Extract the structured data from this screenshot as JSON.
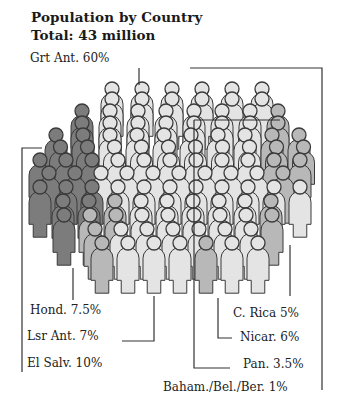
{
  "chart_data": {
    "type": "pictogram",
    "title": "Population by Country",
    "subtitle": "Total: 43 million",
    "total_millions": 43,
    "unit": "% of population",
    "categories": [
      "Grt Ant.",
      "El Salv.",
      "Hond.",
      "Lsr Ant.",
      "C. Rica",
      "Nicar.",
      "Pan.",
      "Baham./Bel./Ber."
    ],
    "values": [
      60,
      10,
      7.5,
      7,
      5,
      6,
      3.5,
      1
    ],
    "labels": [
      {
        "name": "Grt Ant.",
        "value": "60%",
        "text": "Grt Ant. 60%"
      },
      {
        "name": "Hond.",
        "value": "7.5%",
        "text": "Hond. 7.5%"
      },
      {
        "name": "Lsr Ant.",
        "value": "7%",
        "text": "Lsr Ant. 7%"
      },
      {
        "name": "El Salv.",
        "value": "10%",
        "text": "El Salv. 10%"
      },
      {
        "name": "C. Rica",
        "value": "5%",
        "text": "C. Rica 5%"
      },
      {
        "name": "Nicar.",
        "value": "6%",
        "text": "Nicar. 6%"
      },
      {
        "name": "Pan.",
        "value": "3.5%",
        "text": "Pan. 3.5%"
      },
      {
        "name": "Baham./Bel./Ber.",
        "value": "1%",
        "text": "Baham./Bel./Ber. 1%"
      }
    ],
    "grid": false,
    "legend": "callout labels with leader lines"
  },
  "colors": {
    "light": "#e4e4e4",
    "mid": "#b8b8b8",
    "dark": "#7c7c7c",
    "outline": "#3a3a3a",
    "text": "#1a1a1a"
  }
}
